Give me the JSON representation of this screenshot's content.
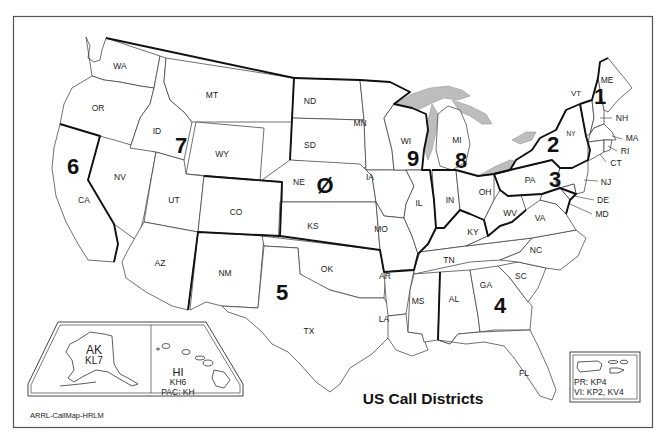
{
  "map": {
    "title": "US Call Districts",
    "credit": "ARRL-CallMap-HRLM",
    "colors": {
      "background": "#ffffff",
      "lines": "#333333",
      "district_lines": "#111111",
      "great_lakes": "#bdbdbd"
    },
    "districts": [
      {
        "id": "d1",
        "label": "1",
        "states": [
          "ME",
          "VT",
          "NH",
          "MA",
          "RI",
          "CT"
        ]
      },
      {
        "id": "d2",
        "label": "2",
        "states": [
          "NY",
          "NJ"
        ]
      },
      {
        "id": "d3",
        "label": "3",
        "states": [
          "PA",
          "DE",
          "MD"
        ]
      },
      {
        "id": "d4",
        "label": "4",
        "states": [
          "KY",
          "TN",
          "VA",
          "NC",
          "SC",
          "GA",
          "AL",
          "FL"
        ]
      },
      {
        "id": "d5",
        "label": "5",
        "states": [
          "NM",
          "TX",
          "OK",
          "AR",
          "LA",
          "MS"
        ]
      },
      {
        "id": "d6",
        "label": "6",
        "states": [
          "CA"
        ]
      },
      {
        "id": "d7",
        "label": "7",
        "states": [
          "WA",
          "OR",
          "ID",
          "MT",
          "WY",
          "NV",
          "UT",
          "AZ"
        ]
      },
      {
        "id": "d8",
        "label": "8",
        "states": [
          "MI",
          "OH",
          "WV"
        ]
      },
      {
        "id": "d9",
        "label": "9",
        "states": [
          "WI",
          "IL",
          "IN"
        ]
      },
      {
        "id": "d0",
        "label": "Ø",
        "states": [
          "ND",
          "SD",
          "NE",
          "KS",
          "MN",
          "IA",
          "MO",
          "CO"
        ]
      }
    ],
    "state_labels": {
      "WA": "WA",
      "OR": "OR",
      "CA": "CA",
      "ID": "ID",
      "NV": "NV",
      "MT": "MT",
      "WY": "WY",
      "UT": "UT",
      "AZ": "AZ",
      "CO": "CO",
      "NM": "NM",
      "ND": "ND",
      "SD": "SD",
      "NE": "NE",
      "KS": "KS",
      "OK": "OK",
      "TX": "TX",
      "MN": "MN",
      "IA": "IA",
      "MO": "MO",
      "AR": "AR",
      "LA": "LA",
      "WI": "WI",
      "IL": "IL",
      "MI": "MI",
      "IN": "IN",
      "OH": "OH",
      "KY": "KY",
      "TN": "TN",
      "MS": "MS",
      "AL": "AL",
      "GA": "GA",
      "FL": "FL",
      "SC": "SC",
      "NC": "NC",
      "VA": "VA",
      "WV": "WV",
      "PA": "PA",
      "NY": "NY",
      "VT": "VT",
      "NH": "NH",
      "ME": "ME",
      "MA": "MA",
      "RI": "RI",
      "CT": "CT",
      "NJ": "NJ",
      "DE": "DE",
      "MD": "MD"
    },
    "insets": {
      "alaska": {
        "name": "AK",
        "prefix": "KL7"
      },
      "hawaii": {
        "name": "HI",
        "prefix": "KH6",
        "pacific": "PAC: KH"
      },
      "caribbean": {
        "pr": "PR: KP4",
        "vi": "VI: KP2, KV4"
      }
    }
  }
}
